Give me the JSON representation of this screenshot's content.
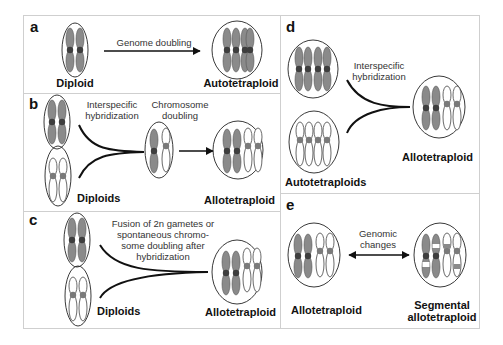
{
  "colors": {
    "border": "#cfcfcf",
    "dark_chromosome": "#8a8a8a",
    "centromere_dark": "#3e3e3e",
    "centromere_light": "#7a7a7a",
    "line": "#111111"
  },
  "panels": {
    "a": {
      "letter": "a",
      "left_label": "Diploid",
      "arrow_label": "Genome doubling",
      "right_label": "Autotetraploid"
    },
    "b": {
      "letter": "b",
      "left_label": "Diploids",
      "merge_label_1": "Interspecific",
      "merge_label_2": "hybridization",
      "arrow_label_1": "Chromosome",
      "arrow_label_2": "doubling",
      "right_label": "Allotetraploid"
    },
    "c": {
      "letter": "c",
      "left_label": "Diploids",
      "merge_label_1": "Fusion of 2n gametes or",
      "merge_label_2": "spontaneous chromo-",
      "merge_label_3": "some doubling after",
      "merge_label_4": "hybridization",
      "right_label": "Allotetraploid"
    },
    "d": {
      "letter": "d",
      "left_label": "Autotetraploids",
      "merge_label_1": "Interspecific",
      "merge_label_2": "hybridization",
      "right_label": "Allotetraploid"
    },
    "e": {
      "letter": "e",
      "left_label": "Allotetraploid",
      "arrow_label_1": "Genomic",
      "arrow_label_2": "changes",
      "right_label_1": "Segmental",
      "right_label_2": "allotetraploid"
    }
  }
}
